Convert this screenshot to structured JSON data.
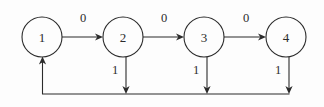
{
  "diagram": {
    "type": "state-transition-diagram",
    "title": "",
    "background_color": "#fdfdfd",
    "stroke_color": "#2b2b2b",
    "nodes": [
      {
        "id": "1",
        "label": "1",
        "cx": 42,
        "cy": 37,
        "r": 20
      },
      {
        "id": "2",
        "label": "2",
        "cx": 123,
        "cy": 37,
        "r": 20
      },
      {
        "id": "3",
        "label": "3",
        "cx": 204,
        "cy": 37,
        "r": 20
      },
      {
        "id": "4",
        "label": "4",
        "cx": 286,
        "cy": 37,
        "r": 20
      }
    ],
    "horizontal_edges": [
      {
        "from": "1",
        "to": "2",
        "label": "0",
        "label_x": 83,
        "label_y": 18,
        "x1": 62,
        "x2": 103,
        "y": 37
      },
      {
        "from": "2",
        "to": "3",
        "label": "0",
        "label_x": 164,
        "label_y": 18,
        "x1": 143,
        "x2": 184,
        "y": 37
      },
      {
        "from": "3",
        "to": "4",
        "label": "0",
        "label_x": 246,
        "label_y": 18,
        "x1": 224,
        "x2": 266,
        "y": 37
      }
    ],
    "vertical_edges": [
      {
        "from": "2",
        "label": "1",
        "label_x": 115,
        "label_y": 70,
        "x": 126,
        "y1": 57,
        "y2": 94
      },
      {
        "from": "3",
        "label": "1",
        "label_x": 196,
        "label_y": 70,
        "x": 207,
        "y1": 57,
        "y2": 94
      },
      {
        "from": "4",
        "label": "1",
        "label_x": 278,
        "label_y": 70,
        "x": 289,
        "y1": 57,
        "y2": 94
      }
    ],
    "return_edge": {
      "to": "1",
      "label": "",
      "bottom_y": 94,
      "x_right": 290,
      "x_left": 42,
      "up_to_y": 58
    }
  }
}
